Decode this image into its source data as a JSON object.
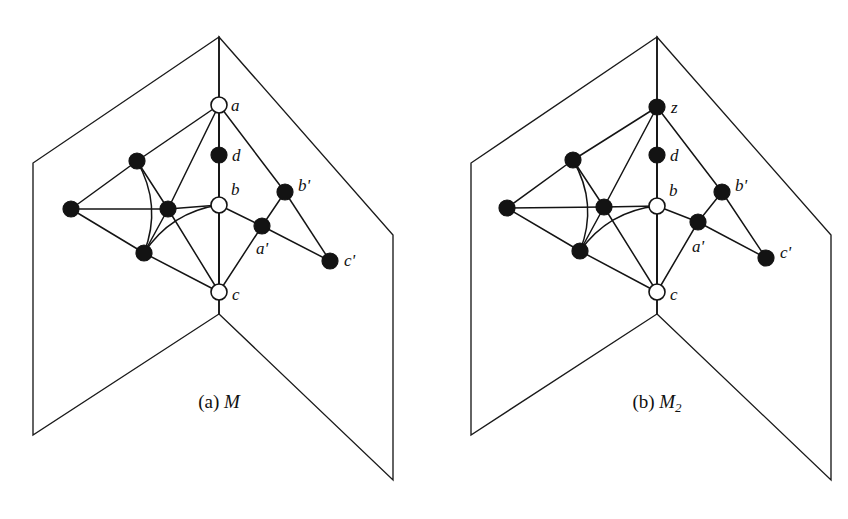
{
  "figure": {
    "background_color": "#ffffff",
    "ink_color": "#131313",
    "width": 848,
    "height": 519
  },
  "panels": [
    {
      "id": "panel-a",
      "caption_prefix": "(a)",
      "caption_name": "M",
      "caption_sub": "",
      "book": {
        "apex": [
          219,
          37
        ],
        "spine_bottom": [
          219,
          314
        ],
        "left_top": [
          33,
          163
        ],
        "left_bottom": [
          33,
          435
        ],
        "right_top": [
          393,
          235
        ],
        "right_bottom": [
          393,
          480
        ],
        "fold_bottom_left": [
          33,
          435
        ],
        "fold_bottom_right": [
          393,
          480
        ]
      },
      "nodes": [
        {
          "id": "a",
          "label": "a",
          "style": "hollow",
          "x": 219,
          "y": 105,
          "label_dx": 12,
          "label_dy": 2
        },
        {
          "id": "d",
          "label": "d",
          "style": "filled",
          "x": 219,
          "y": 155,
          "label_dx": 13,
          "label_dy": 2
        },
        {
          "id": "b",
          "label": "b",
          "style": "hollow",
          "x": 219,
          "y": 205,
          "label_dx": 12,
          "label_dy": -14
        },
        {
          "id": "c",
          "label": "c",
          "style": "hollow",
          "x": 219,
          "y": 292,
          "label_dx": 13,
          "label_dy": 4
        },
        {
          "id": "p",
          "label": "",
          "style": "filled",
          "x": 137,
          "y": 161,
          "label_dx": 0,
          "label_dy": 0
        },
        {
          "id": "q",
          "label": "",
          "style": "filled",
          "x": 168,
          "y": 209,
          "label_dx": 0,
          "label_dy": 0
        },
        {
          "id": "r",
          "label": "",
          "style": "filled",
          "x": 144,
          "y": 253,
          "label_dx": 0,
          "label_dy": 0
        },
        {
          "id": "l",
          "label": "",
          "style": "filled",
          "x": 71,
          "y": 209,
          "label_dx": 0,
          "label_dy": 0
        },
        {
          "id": "bp",
          "label": "b'",
          "style": "filled",
          "x": 285,
          "y": 192,
          "label_dx": 13,
          "label_dy": -5
        },
        {
          "id": "ap",
          "label": "a'",
          "style": "filled",
          "x": 262,
          "y": 226,
          "label_dx": -6,
          "label_dy": 24
        },
        {
          "id": "cp",
          "label": "c'",
          "style": "filled",
          "x": 330,
          "y": 261,
          "label_dx": 14,
          "label_dy": 1
        }
      ],
      "straight_edges": [
        [
          "a",
          "d"
        ],
        [
          "d",
          "b"
        ],
        [
          "b",
          "c"
        ],
        [
          "a",
          "p"
        ],
        [
          "a",
          "q"
        ],
        [
          "a",
          "bp"
        ],
        [
          "p",
          "q"
        ],
        [
          "p",
          "l"
        ],
        [
          "l",
          "q"
        ],
        [
          "l",
          "r"
        ],
        [
          "q",
          "r"
        ],
        [
          "q",
          "b"
        ],
        [
          "q",
          "c"
        ],
        [
          "r",
          "c"
        ],
        [
          "b",
          "ap"
        ],
        [
          "ap",
          "bp"
        ],
        [
          "ap",
          "cp"
        ],
        [
          "ap",
          "c"
        ],
        [
          "bp",
          "cp"
        ]
      ],
      "curved_edges": [
        {
          "from": "p",
          "to": "r",
          "bow": -22,
          "note": "curve bulging left"
        },
        {
          "from": "r",
          "to": "b",
          "bow": -20,
          "note": "curve bulging down-right"
        }
      ]
    },
    {
      "id": "panel-b",
      "caption_prefix": "(b)",
      "caption_name": "M",
      "caption_sub": "2",
      "book": {
        "apex": [
          657,
          37
        ],
        "spine_bottom": [
          657,
          314
        ],
        "left_top": [
          471,
          163
        ],
        "left_bottom": [
          471,
          435
        ],
        "right_top": [
          831,
          235
        ],
        "right_bottom": [
          831,
          480
        ],
        "fold_bottom_left": [
          471,
          435
        ],
        "fold_bottom_right": [
          831,
          480
        ]
      },
      "nodes": [
        {
          "id": "a",
          "label": "z",
          "style": "filled",
          "x": 657,
          "y": 107,
          "label_dx": 14,
          "label_dy": 2
        },
        {
          "id": "d",
          "label": "d",
          "style": "filled",
          "x": 657,
          "y": 155,
          "label_dx": 13,
          "label_dy": 2
        },
        {
          "id": "b",
          "label": "b",
          "style": "hollow",
          "x": 657,
          "y": 206,
          "label_dx": 12,
          "label_dy": -14
        },
        {
          "id": "c",
          "label": "c",
          "style": "hollow",
          "x": 657,
          "y": 292,
          "label_dx": 13,
          "label_dy": 4
        },
        {
          "id": "p",
          "label": "",
          "style": "filled",
          "x": 573,
          "y": 160,
          "label_dx": 0,
          "label_dy": 0
        },
        {
          "id": "q",
          "label": "",
          "style": "filled",
          "x": 604,
          "y": 207,
          "label_dx": 0,
          "label_dy": 0
        },
        {
          "id": "r",
          "label": "",
          "style": "filled",
          "x": 580,
          "y": 251,
          "label_dx": 0,
          "label_dy": 0
        },
        {
          "id": "l",
          "label": "",
          "style": "filled",
          "x": 507,
          "y": 208,
          "label_dx": 0,
          "label_dy": 0
        },
        {
          "id": "bp",
          "label": "b'",
          "style": "filled",
          "x": 722,
          "y": 192,
          "label_dx": 13,
          "label_dy": -5
        },
        {
          "id": "ap",
          "label": "a'",
          "style": "filled",
          "x": 698,
          "y": 222,
          "label_dx": -6,
          "label_dy": 26
        },
        {
          "id": "cp",
          "label": "c'",
          "style": "filled",
          "x": 766,
          "y": 258,
          "label_dx": 14,
          "label_dy": -4
        }
      ],
      "straight_edges": [
        [
          "a",
          "d"
        ],
        [
          "d",
          "b"
        ],
        [
          "b",
          "c"
        ],
        [
          "a",
          "p"
        ],
        [
          "a",
          "q"
        ],
        [
          "a",
          "bp"
        ],
        [
          "p",
          "q"
        ],
        [
          "p",
          "l"
        ],
        [
          "l",
          "q"
        ],
        [
          "l",
          "r"
        ],
        [
          "q",
          "r"
        ],
        [
          "q",
          "b"
        ],
        [
          "q",
          "c"
        ],
        [
          "r",
          "c"
        ],
        [
          "b",
          "ap"
        ],
        [
          "ap",
          "bp"
        ],
        [
          "ap",
          "cp"
        ],
        [
          "ap",
          "c"
        ],
        [
          "bp",
          "cp"
        ]
      ],
      "curved_edges": [
        {
          "from": "p",
          "to": "r",
          "bow": -22,
          "note": "curve bulging left"
        },
        {
          "from": "r",
          "to": "b",
          "bow": -20,
          "note": "curve bulging down-right"
        }
      ]
    }
  ],
  "captions": [
    {
      "id": "caption-a",
      "x": 219,
      "y": 408,
      "prefix": "(a)",
      "name": "M",
      "sub": ""
    },
    {
      "id": "caption-b",
      "x": 657,
      "y": 408,
      "prefix": "(b)",
      "name": "M",
      "sub": "2"
    }
  ],
  "geometry": {
    "node_radius_filled": 8,
    "node_radius_hollow": 8
  }
}
